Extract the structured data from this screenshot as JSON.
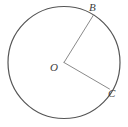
{
  "figure": {
    "type": "geometry-diagram",
    "canvas": {
      "width": 128,
      "height": 127,
      "background": "#ffffff"
    },
    "circle": {
      "name": "main-circle",
      "center_x": 64,
      "center_y": 62.5,
      "radius": 56,
      "stroke": "#555555",
      "stroke_width": 1.2,
      "fill": "none"
    },
    "radii": [
      {
        "name": "radius-ob",
        "from": "O",
        "to": "B",
        "x1": 64,
        "y1": 62.5,
        "x2": 93.5,
        "y2": 15.0,
        "stroke": "#8a8a8a",
        "stroke_width": 1
      },
      {
        "name": "radius-oc",
        "from": "O",
        "to": "C",
        "x1": 64,
        "y1": 62.5,
        "x2": 109.5,
        "y2": 89.0,
        "stroke": "#8a8a8a",
        "stroke_width": 1
      }
    ],
    "labels": [
      {
        "id": "B",
        "text": "B",
        "x": 89,
        "y": 2,
        "size": "normal",
        "color": "#3d3d3d"
      },
      {
        "id": "O",
        "text": "O",
        "x": 50,
        "y": 62,
        "size": "normal",
        "color": "#3d3d3d"
      },
      {
        "id": "C",
        "text": "C",
        "x": 108,
        "y": 88,
        "size": "normal",
        "color": "#3d3d3d"
      }
    ]
  },
  "chart_data": {
    "type": "diagram",
    "title": "",
    "shape": "circle",
    "center_label": "O",
    "point_labels": [
      "B",
      "C"
    ],
    "angle_at_center_degrees": 89,
    "radius_px": 56
  }
}
